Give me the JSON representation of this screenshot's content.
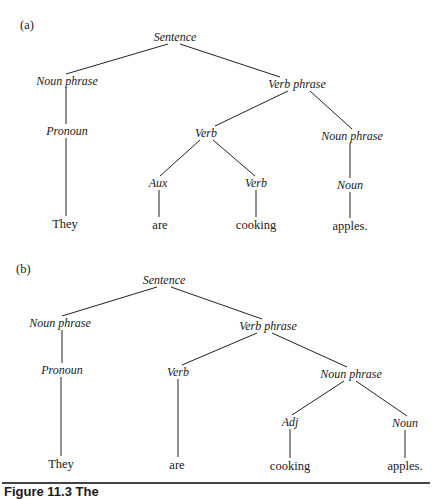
{
  "figure": {
    "caption_partial": "Figure 11.3  The"
  },
  "tree_a": {
    "label": "(a)",
    "nodes": {
      "s": "Sentence",
      "np1": "Noun phrase",
      "vp": "Verb phrase",
      "pron": "Pronoun",
      "verb": "Verb",
      "np2": "Noun phrase",
      "aux": "Aux",
      "verb2": "Verb",
      "noun": "Noun"
    },
    "words": [
      "They",
      "are",
      "cooking",
      "apples."
    ]
  },
  "tree_b": {
    "label": "(b)",
    "nodes": {
      "s": "Sentence",
      "np1": "Noun phrase",
      "vp": "Verb phrase",
      "pron": "Pronoun",
      "verb": "Verb",
      "np2": "Noun phrase",
      "adj": "Adj",
      "noun": "Noun"
    },
    "words": [
      "They",
      "are",
      "cooking",
      "apples."
    ]
  }
}
